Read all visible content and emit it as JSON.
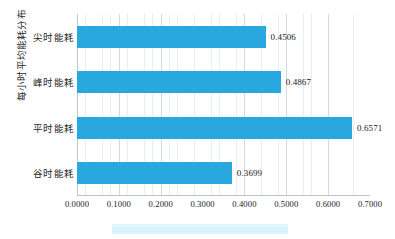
{
  "chart_data": {
    "type": "bar",
    "orientation": "horizontal",
    "title": "",
    "subtitle": "",
    "xlabel": "",
    "ylabel": "每小时平均能耗分布",
    "categories": [
      "尖时能耗",
      "峰时能耗",
      "平时能耗",
      "谷时能耗"
    ],
    "values": [
      0.4506,
      0.4867,
      0.6571,
      0.3699
    ],
    "value_labels": [
      "0.4506",
      "0.4867",
      "0.6571",
      "0.3699"
    ],
    "xlim": [
      0.0,
      0.7
    ],
    "xticks": [
      0.0,
      0.1,
      0.2,
      0.3,
      0.4,
      0.5,
      0.6,
      0.7
    ],
    "xtick_labels": [
      "0.0000",
      "0.1000",
      "0.2000",
      "0.3000",
      "0.4000",
      "0.5000",
      "0.6000",
      "0.7000"
    ],
    "minor_tick_step": 0.02,
    "grid": true,
    "grid_axis": "x",
    "legend": false,
    "legend_position": "bottom",
    "series": [
      {
        "name": "每小时平均能耗分布",
        "color": "#29a8e0",
        "values": [
          0.4506,
          0.4867,
          0.6571,
          0.3699
        ]
      }
    ]
  },
  "colors": {
    "bar": "#29a8e0",
    "grid_minor": "#e9eef2",
    "grid_major": "#d3dade",
    "axis_line": "#bcc4ca",
    "text": "#202020",
    "background": "#ffffff",
    "legend_band": "#ddf4fd"
  }
}
